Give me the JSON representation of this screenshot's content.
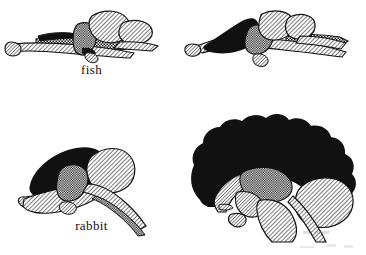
{
  "figure": {
    "type": "comparative-anatomy-illustration",
    "background_color": "#ffffff",
    "ink_color": "#111111",
    "layout": "2x2 grid of labeled brain drawings",
    "panel_order": [
      "fish",
      "reptile",
      "rabbit",
      "man"
    ]
  },
  "panels": [
    {
      "key": "fish",
      "label": "fish",
      "row": 0,
      "col": 0,
      "cerebrum_fill": "solid-black",
      "cerebrum_relative_size": "very small",
      "regions": [
        {
          "name": "olfactory-bulb",
          "fill": "hatched"
        },
        {
          "name": "cerebrum",
          "fill": "solid-black"
        },
        {
          "name": "thalamus",
          "fill": "checkered"
        },
        {
          "name": "optic-lobe",
          "fill": "hatched"
        },
        {
          "name": "cerebellum",
          "fill": "hatched"
        },
        {
          "name": "medulla",
          "fill": "hatched"
        },
        {
          "name": "spinal-cord",
          "fill": "checkered"
        }
      ]
    },
    {
      "key": "reptile",
      "label": "reptile",
      "row": 0,
      "col": 1,
      "cerebrum_fill": "solid-black",
      "cerebrum_relative_size": "small",
      "regions": [
        {
          "name": "olfactory-bulb",
          "fill": "hatched"
        },
        {
          "name": "cerebrum",
          "fill": "solid-black"
        },
        {
          "name": "thalamus",
          "fill": "checkered"
        },
        {
          "name": "cerebellum",
          "fill": "hatched"
        },
        {
          "name": "medulla",
          "fill": "hatched"
        },
        {
          "name": "spinal-cord",
          "fill": "checkered"
        }
      ]
    },
    {
      "key": "rabbit",
      "label": "rabbit",
      "row": 1,
      "col": 0,
      "cerebrum_fill": "solid-black",
      "cerebrum_relative_size": "medium",
      "regions": [
        {
          "name": "olfactory-bulb",
          "fill": "hatched"
        },
        {
          "name": "cerebrum",
          "fill": "solid-black"
        },
        {
          "name": "thalamus",
          "fill": "checkered"
        },
        {
          "name": "cerebellum",
          "fill": "hatched"
        },
        {
          "name": "brainstem",
          "fill": "hatched"
        },
        {
          "name": "spinal-cord",
          "fill": "checkered"
        }
      ]
    },
    {
      "key": "man",
      "label": "man",
      "row": 1,
      "col": 1,
      "cerebrum_fill": "solid-black",
      "cerebrum_relative_size": "very large, dominant, lobed outline",
      "regions": [
        {
          "name": "cerebrum",
          "fill": "solid-black"
        },
        {
          "name": "corpus-callosum",
          "fill": "hatched"
        },
        {
          "name": "thalamus",
          "fill": "checkered"
        },
        {
          "name": "pituitary",
          "fill": "hatched"
        },
        {
          "name": "midbrain",
          "fill": "hatched"
        },
        {
          "name": "cerebellum",
          "fill": "hatched"
        },
        {
          "name": "brainstem",
          "fill": "hatched"
        },
        {
          "name": "spinal-cord",
          "fill": "hatched"
        }
      ]
    }
  ]
}
